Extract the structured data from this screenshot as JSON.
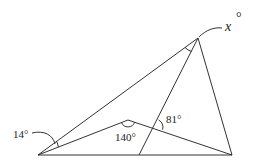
{
  "diagram": {
    "type": "geometry-figure",
    "labels": {
      "angle_14": "14°",
      "angle_140": "140°",
      "angle_81": "81°",
      "angle_x": "x",
      "angle_x_degree": "°"
    },
    "points": {
      "A": [
        38,
        155
      ],
      "B": [
        232,
        155
      ],
      "C": [
        198,
        38
      ],
      "D": [
        128,
        120
      ],
      "E": [
        139,
        155
      ],
      "P": [
        155,
        127
      ]
    },
    "segments": [
      [
        "A",
        "B"
      ],
      [
        "A",
        "C"
      ],
      [
        "C",
        "B"
      ],
      [
        "A",
        "D"
      ],
      [
        "D",
        "B"
      ],
      [
        "C",
        "E"
      ]
    ],
    "angles": [
      {
        "vertex": "A",
        "between": [
          "C",
          "D"
        ],
        "value": 14
      },
      {
        "vertex": "D",
        "between": [
          "A",
          "B"
        ],
        "value": 140
      },
      {
        "vertex": "P",
        "between": [
          "C",
          "B"
        ],
        "value": 81
      },
      {
        "vertex": "C",
        "between": [
          "A",
          "E"
        ],
        "value": "x"
      }
    ]
  }
}
